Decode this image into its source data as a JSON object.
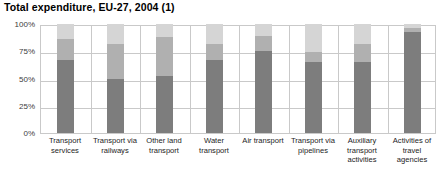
{
  "chart_data": {
    "type": "bar",
    "subtype": "stacked-percentage",
    "title": "Total expenditure, EU-27, 2004 (1)",
    "xlabel": "",
    "ylabel": "",
    "ylim": [
      0,
      100
    ],
    "yticks": [
      "0%",
      "25%",
      "50%",
      "75%",
      "100%"
    ],
    "ytick_values": [
      0,
      25,
      50,
      75,
      100
    ],
    "grid": true,
    "legend": "none",
    "categories": [
      "Transport services",
      "Transport via railways",
      "Other land transport",
      "Water transport",
      "Air transport",
      "Transport via pipelines",
      "Auxiliary transport activities",
      "Activities of travel agencies"
    ],
    "series": [
      {
        "name": "segment-bottom",
        "color": "#7d7d7d",
        "values": [
          67,
          50,
          52,
          67,
          75,
          65,
          65,
          93
        ]
      },
      {
        "name": "segment-middle",
        "color": "#b0b0b0",
        "values": [
          19,
          32,
          36,
          15,
          14,
          9,
          17,
          3
        ]
      },
      {
        "name": "segment-top",
        "color": "#d5d5d5",
        "values": [
          14,
          18,
          12,
          18,
          11,
          26,
          18,
          4
        ]
      }
    ]
  },
  "axis": {
    "ticks": [
      {
        "label": "100%",
        "value": 100
      },
      {
        "label": "75%",
        "value": 75
      },
      {
        "label": "50%",
        "value": 50
      },
      {
        "label": "25%",
        "value": 25
      },
      {
        "label": "0%",
        "value": 0
      }
    ]
  },
  "colors": {
    "segment_bottom": "#7d7d7d",
    "segment_middle": "#b0b0b0",
    "segment_top": "#d5d5d5",
    "grid": "#c9c9c9",
    "axis_text": "#3c3c3c",
    "title_text": "#000000",
    "background": "#ffffff"
  }
}
